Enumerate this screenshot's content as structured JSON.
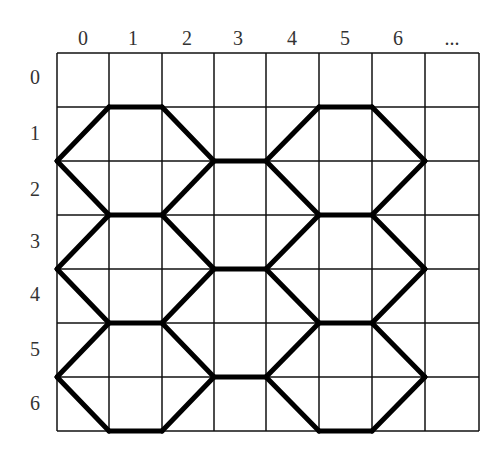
{
  "diagram": {
    "type": "grid-with-hexagonal-path-tiling",
    "column_labels": [
      "0",
      "1",
      "2",
      "3",
      "4",
      "5",
      "6",
      "..."
    ],
    "row_labels": [
      "0",
      "1",
      "2",
      "3",
      "4",
      "5",
      "6"
    ],
    "grid": {
      "columns": 8,
      "rows": 7,
      "x_lines": [
        57,
        109,
        162,
        214,
        266,
        319,
        372,
        425,
        479
      ],
      "y_lines": [
        53,
        107,
        161,
        215,
        269,
        323,
        377,
        431
      ],
      "line_color": "#111111",
      "line_width": 1.5
    },
    "path": {
      "color": "#000000",
      "width": 5,
      "segments": [
        [
          [
            0,
            2
          ],
          [
            1,
            1
          ]
        ],
        [
          [
            1,
            1
          ],
          [
            2,
            1
          ]
        ],
        [
          [
            2,
            1
          ],
          [
            3,
            2
          ]
        ],
        [
          [
            3,
            2
          ],
          [
            4,
            2
          ]
        ],
        [
          [
            4,
            2
          ],
          [
            5,
            1
          ]
        ],
        [
          [
            5,
            1
          ],
          [
            6,
            1
          ]
        ],
        [
          [
            6,
            1
          ],
          [
            7,
            2
          ]
        ],
        [
          [
            0,
            2
          ],
          [
            1,
            3
          ]
        ],
        [
          [
            1,
            3
          ],
          [
            2,
            3
          ]
        ],
        [
          [
            2,
            3
          ],
          [
            3,
            2
          ]
        ],
        [
          [
            4,
            2
          ],
          [
            5,
            3
          ]
        ],
        [
          [
            5,
            3
          ],
          [
            6,
            3
          ]
        ],
        [
          [
            6,
            3
          ],
          [
            7,
            2
          ]
        ],
        [
          [
            0,
            4
          ],
          [
            1,
            3
          ]
        ],
        [
          [
            2,
            3
          ],
          [
            3,
            4
          ]
        ],
        [
          [
            3,
            4
          ],
          [
            4,
            4
          ]
        ],
        [
          [
            4,
            4
          ],
          [
            5,
            3
          ]
        ],
        [
          [
            6,
            3
          ],
          [
            7,
            4
          ]
        ],
        [
          [
            0,
            4
          ],
          [
            1,
            5
          ]
        ],
        [
          [
            1,
            5
          ],
          [
            2,
            5
          ]
        ],
        [
          [
            2,
            5
          ],
          [
            3,
            4
          ]
        ],
        [
          [
            4,
            4
          ],
          [
            5,
            5
          ]
        ],
        [
          [
            5,
            5
          ],
          [
            6,
            5
          ]
        ],
        [
          [
            6,
            5
          ],
          [
            7,
            4
          ]
        ],
        [
          [
            0,
            6
          ],
          [
            1,
            5
          ]
        ],
        [
          [
            2,
            5
          ],
          [
            3,
            6
          ]
        ],
        [
          [
            3,
            6
          ],
          [
            4,
            6
          ]
        ],
        [
          [
            4,
            6
          ],
          [
            5,
            5
          ]
        ],
        [
          [
            6,
            5
          ],
          [
            7,
            6
          ]
        ],
        [
          [
            0,
            6
          ],
          [
            1,
            7
          ]
        ],
        [
          [
            1,
            7
          ],
          [
            2,
            7
          ]
        ],
        [
          [
            2,
            7
          ],
          [
            3,
            6
          ]
        ],
        [
          [
            4,
            6
          ],
          [
            5,
            7
          ]
        ],
        [
          [
            5,
            7
          ],
          [
            6,
            7
          ]
        ],
        [
          [
            6,
            7
          ],
          [
            7,
            6
          ]
        ]
      ]
    },
    "label_positions": {
      "column_label_y": 45,
      "column_label_x": [
        83,
        133,
        187,
        238,
        292,
        345,
        398,
        452
      ],
      "row_label_x": 35,
      "row_label_y": [
        84,
        140,
        196,
        248,
        301,
        356,
        410
      ]
    }
  }
}
